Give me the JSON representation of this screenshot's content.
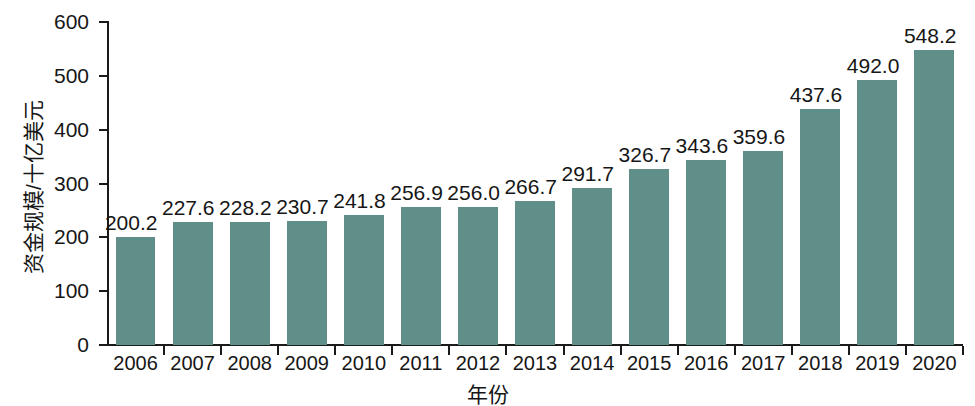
{
  "chart_data": {
    "type": "bar",
    "title": "",
    "subtitle": "",
    "xlabel": "年份",
    "ylabel": "资金规模/十亿美元",
    "categories": [
      "2006",
      "2007",
      "2008",
      "2009",
      "2010",
      "2011",
      "2012",
      "2013",
      "2014",
      "2015",
      "2016",
      "2017",
      "2018",
      "2019",
      "2020"
    ],
    "values": [
      200.2,
      227.6,
      228.2,
      230.7,
      241.8,
      256.9,
      256.0,
      266.7,
      291.7,
      326.7,
      343.6,
      359.6,
      437.6,
      492.0,
      548.2
    ],
    "value_labels": [
      "200.2",
      "227.6",
      "228.2",
      "230.7",
      "241.8",
      "256.9",
      "256.0",
      "266.7",
      "291.7",
      "326.7",
      "343.6",
      "359.6",
      "437.6",
      "492.0",
      "548.2"
    ],
    "ylim": [
      0,
      600
    ],
    "yticks": [
      0,
      100,
      200,
      300,
      400,
      500,
      600
    ],
    "ytick_labels": [
      "0",
      "100",
      "200",
      "300",
      "400",
      "500",
      "600"
    ],
    "grid": false,
    "legend": null,
    "legend_position": "none",
    "bar_color": "#5f8f88",
    "axis_color": "#1a1a1a",
    "text_color": "#161616",
    "background_color": "#ffffff"
  }
}
